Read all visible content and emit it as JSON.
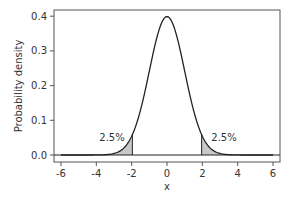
{
  "chart_data": {
    "type": "area",
    "title": "",
    "xlabel": "x",
    "ylabel": "Probability density",
    "xlim": [
      -6.4,
      6.4
    ],
    "ylim": [
      -0.02,
      0.42
    ],
    "x_ticks": [
      -6,
      -4,
      -2,
      0,
      2,
      4,
      6
    ],
    "x_tick_labels": [
      "-6",
      "-4",
      "-2",
      "0",
      "2",
      "4",
      "6"
    ],
    "y_ticks": [
      0.0,
      0.1,
      0.2,
      0.3,
      0.4
    ],
    "y_tick_labels": [
      "0.0",
      "0.1",
      "0.2",
      "0.3",
      "0.4"
    ],
    "grid": false,
    "legend": null,
    "series": [
      {
        "name": "Standard normal density N(0,1)",
        "x": [
          -6,
          -5,
          -4,
          -3,
          -2.5,
          -2,
          -1.5,
          -1,
          -0.5,
          0,
          0.5,
          1,
          1.5,
          2,
          2.5,
          3,
          4,
          5,
          6
        ],
        "values": [
          0.0,
          0.0,
          0.0001,
          0.0044,
          0.0175,
          0.054,
          0.1295,
          0.242,
          0.3521,
          0.3989,
          0.3521,
          0.242,
          0.1295,
          0.054,
          0.0175,
          0.0044,
          0.0001,
          0.0,
          0.0
        ]
      }
    ],
    "shaded_regions": [
      {
        "from": -6,
        "to": -1.96,
        "label": "2.5%",
        "color": "#c8c8c8"
      },
      {
        "from": 1.96,
        "to": 6,
        "label": "2.5%",
        "color": "#c8c8c8"
      }
    ],
    "annotations": [
      {
        "text": "2.5%",
        "x": -3.2,
        "y": 0.05
      },
      {
        "text": "2.5%",
        "x": 3.2,
        "y": 0.05
      }
    ]
  },
  "labels": {
    "xlabel": "x",
    "ylabel": "Probability density",
    "left_tail": "2.5%",
    "right_tail": "2.5%",
    "xticks": [
      "-6",
      "-4",
      "-2",
      "0",
      "2",
      "4",
      "6"
    ],
    "yticks": [
      "0.0",
      "0.1",
      "0.2",
      "0.3",
      "0.4"
    ]
  }
}
